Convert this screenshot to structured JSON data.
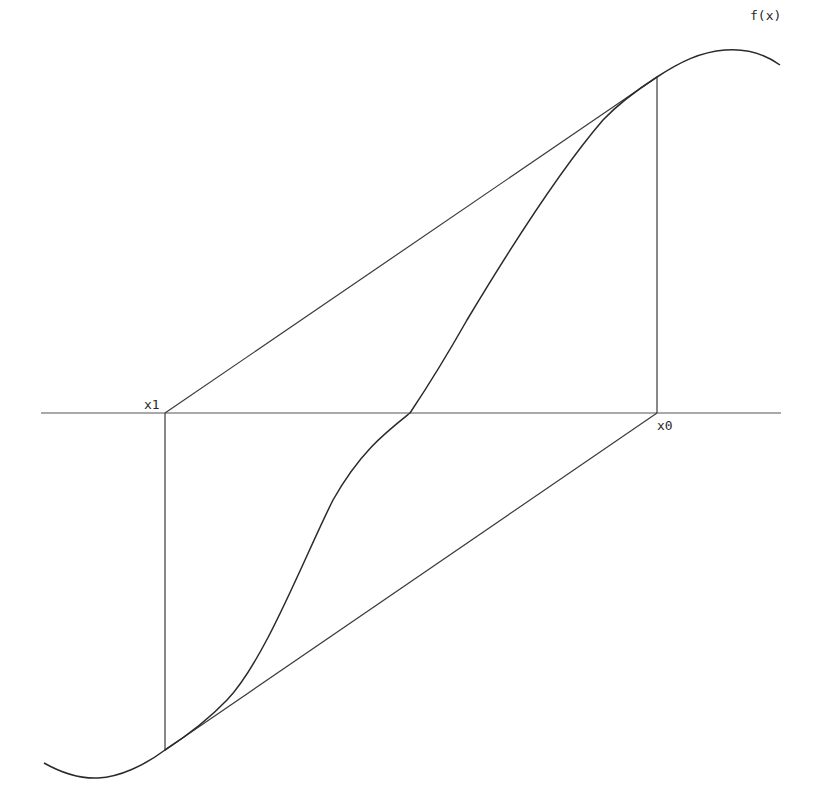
{
  "diagram": {
    "type": "secant-method-illustration",
    "labels": {
      "function": "f(x)",
      "x0": "x0",
      "x1": "x1"
    },
    "colors": {
      "background": "#ffffff",
      "stroke": "#2a2a2a"
    },
    "elements": [
      "x-axis",
      "curve f(x)",
      "vertical line at x0 up to f(x0)",
      "vertical line at x1 down to f(x1)",
      "secant from (x1, 0) to (x0, f(x0))",
      "secant from (x1, f(x1)) to (x0, 0)"
    ]
  }
}
